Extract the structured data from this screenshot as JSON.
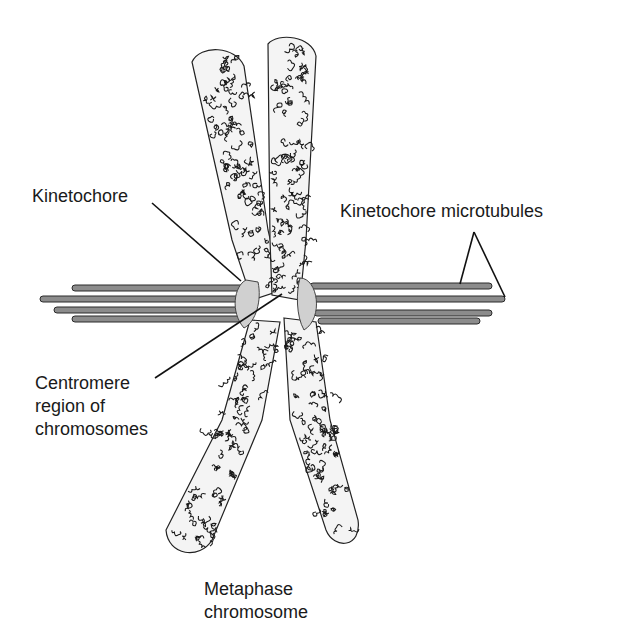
{
  "figure": {
    "labels": {
      "kinetochore": "Kinetochore",
      "kinetochore_microtubules": "Kinetochore microtubules",
      "centromere_line1": "Centromere",
      "centromere_line2": "region of",
      "centromere_line3": "chromosomes",
      "caption_line1": "Metaphase",
      "caption_line2": "chromosome"
    },
    "colors": {
      "microtubule": "#8c8c8c",
      "kinetochore": "#d0d0d0",
      "chromatin_line": "#1a1a1a",
      "background": "#ffffff"
    }
  }
}
